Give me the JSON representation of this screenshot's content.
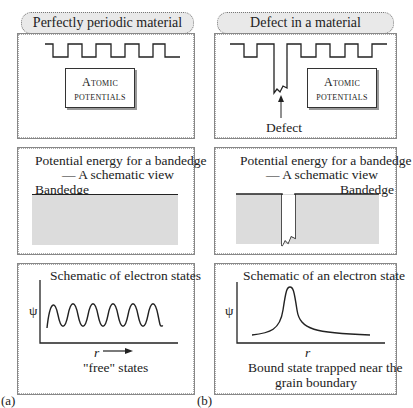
{
  "panels": {
    "a": {
      "label": "(a)",
      "title": "Perfectly periodic material",
      "atomic_box": {
        "line1": "Atomic",
        "line2": "potentials"
      },
      "potential": {
        "title_line1": "Potential energy for a bandedge",
        "title_line2": "— A schematic view",
        "bandedge_label": "Bandedge"
      },
      "states": {
        "title": "Schematic of electron states",
        "y_label": "ψ",
        "x_label": "r",
        "caption": "\"free\" states"
      }
    },
    "b": {
      "label": "(b)",
      "title": "Defect in a material",
      "atomic_box": {
        "line1": "Atomic",
        "line2": "potentials"
      },
      "defect_label": "Defect",
      "potential": {
        "title_line1": "Potential energy for a bandedge",
        "title_line2": "— A schematic view",
        "bandedge_label": "Bandedge"
      },
      "states": {
        "title": "Schematic of an  electron state",
        "y_label": "ψ",
        "x_label": "r",
        "caption_line1": "Bound state trapped near the",
        "caption_line2": "grain boundary"
      }
    }
  },
  "colors": {
    "line": "#222222",
    "fill": "#d8d8d8",
    "pill": "#e9e9e9"
  }
}
